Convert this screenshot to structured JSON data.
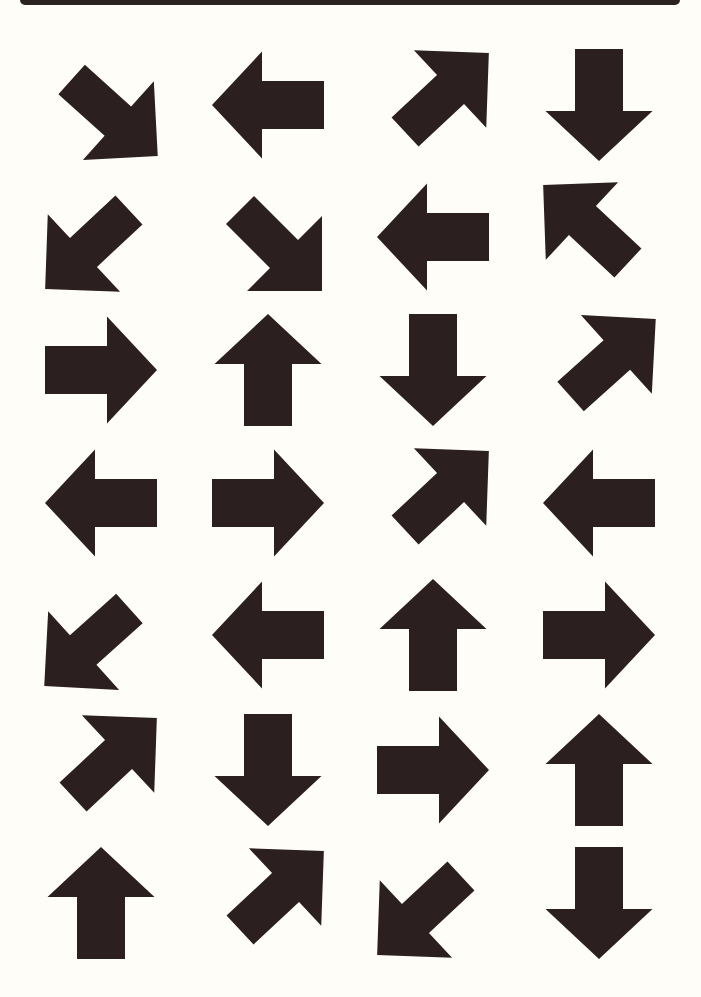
{
  "page": {
    "background": "#fffdf8",
    "top_bar_color": "#2b2222",
    "arrow_color": "#2b1f1f"
  },
  "grid": {
    "columns": 4,
    "rows": 7,
    "column_centers": [
      101,
      268,
      433,
      599
    ],
    "row_centers": [
      105,
      237,
      370,
      503,
      635,
      770,
      903
    ]
  },
  "arrows": [
    {
      "row": 0,
      "col": 0,
      "direction": "down-right",
      "tilt": -3
    },
    {
      "row": 0,
      "col": 1,
      "direction": "left",
      "tilt": 0
    },
    {
      "row": 0,
      "col": 2,
      "direction": "up-right",
      "tilt": 2
    },
    {
      "row": 0,
      "col": 3,
      "direction": "down",
      "tilt": 0
    },
    {
      "row": 1,
      "col": 0,
      "direction": "down-left",
      "tilt": 2
    },
    {
      "row": 1,
      "col": 1,
      "direction": "down-right",
      "tilt": 0
    },
    {
      "row": 1,
      "col": 2,
      "direction": "left",
      "tilt": 0
    },
    {
      "row": 1,
      "col": 3,
      "direction": "up-left",
      "tilt": -2
    },
    {
      "row": 2,
      "col": 0,
      "direction": "right",
      "tilt": 0
    },
    {
      "row": 2,
      "col": 1,
      "direction": "up",
      "tilt": 0
    },
    {
      "row": 2,
      "col": 2,
      "direction": "down",
      "tilt": 0
    },
    {
      "row": 2,
      "col": 3,
      "direction": "up-right",
      "tilt": 3
    },
    {
      "row": 3,
      "col": 0,
      "direction": "left",
      "tilt": 0
    },
    {
      "row": 3,
      "col": 1,
      "direction": "right",
      "tilt": 0
    },
    {
      "row": 3,
      "col": 2,
      "direction": "up-right",
      "tilt": 2
    },
    {
      "row": 3,
      "col": 3,
      "direction": "left",
      "tilt": 0
    },
    {
      "row": 4,
      "col": 0,
      "direction": "down-left",
      "tilt": 3
    },
    {
      "row": 4,
      "col": 1,
      "direction": "left",
      "tilt": 0
    },
    {
      "row": 4,
      "col": 2,
      "direction": "up",
      "tilt": 0
    },
    {
      "row": 4,
      "col": 3,
      "direction": "right",
      "tilt": 0
    },
    {
      "row": 5,
      "col": 0,
      "direction": "up-right",
      "tilt": 2
    },
    {
      "row": 5,
      "col": 1,
      "direction": "down",
      "tilt": 0
    },
    {
      "row": 5,
      "col": 2,
      "direction": "right",
      "tilt": 0
    },
    {
      "row": 5,
      "col": 3,
      "direction": "up",
      "tilt": 0
    },
    {
      "row": 6,
      "col": 0,
      "direction": "up",
      "tilt": 0
    },
    {
      "row": 6,
      "col": 1,
      "direction": "up-right",
      "tilt": 2
    },
    {
      "row": 6,
      "col": 2,
      "direction": "down-left",
      "tilt": 2
    },
    {
      "row": 6,
      "col": 3,
      "direction": "down",
      "tilt": 0
    }
  ]
}
